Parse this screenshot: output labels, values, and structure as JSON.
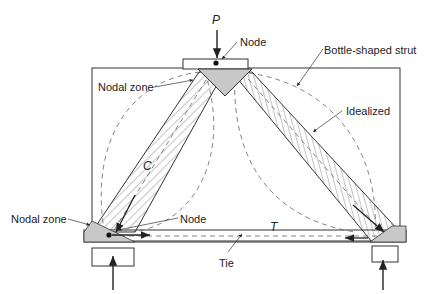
{
  "diagram": {
    "type": "strut-and-tie model of deep beam",
    "labels": {
      "load": "P",
      "node_top": "Node",
      "bottle_strut": "Bottle-shaped strut",
      "nodal_zone_top": "Nodal zone",
      "idealized": "Idealized",
      "compression": "C",
      "nodal_zone_left": "Nodal zone",
      "node_bottom": "Node",
      "tension": "T",
      "tie": "Tie"
    },
    "colors": {
      "line": "#333333",
      "nodal_fill": "#c8c8c8",
      "hatch": "#555555",
      "dashed": "#666666"
    }
  }
}
